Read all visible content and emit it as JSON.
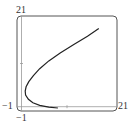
{
  "chart_data": {
    "type": "line",
    "title": "",
    "xlabel": "",
    "ylabel": "",
    "xlim": [
      -1,
      21
    ],
    "ylim": [
      -1,
      21
    ],
    "grid": false,
    "legend": null,
    "tick_labels": {
      "x_min": "−1",
      "x_max": "21",
      "y_min": "−1",
      "y_max": "21"
    },
    "series": [
      {
        "name": "curve",
        "points": [
          [
            8.0,
            -0.3
          ],
          [
            6.0,
            -0.1
          ],
          [
            4.0,
            0.3
          ],
          [
            2.5,
            0.9
          ],
          [
            1.5,
            1.7
          ],
          [
            0.9,
            2.7
          ],
          [
            0.8,
            3.6
          ],
          [
            1.0,
            4.6
          ],
          [
            1.6,
            5.8
          ],
          [
            2.6,
            7.2
          ],
          [
            4.0,
            8.8
          ],
          [
            6.0,
            10.6
          ],
          [
            8.5,
            12.4
          ],
          [
            11.5,
            14.4
          ],
          [
            14.5,
            16.3
          ],
          [
            17.0,
            18.1
          ]
        ],
        "color": "#222222"
      }
    ]
  }
}
